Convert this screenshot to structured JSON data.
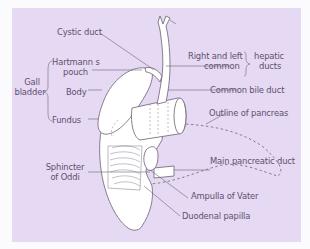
{
  "diagram": {
    "colors": {
      "background": "#e6d9f3",
      "organ_fill": "#ffffff",
      "outline": "#6b6070",
      "text": "#5e4f6e",
      "leader": "#6b6474"
    },
    "labels": {
      "cystic_duct": "Cystic duct",
      "hartmann_line1": "Hartmann s",
      "hartmann_line2": "pouch",
      "gall_line1": "Gall",
      "gall_line2": "bladder",
      "body": "Body",
      "fundus": "Fundus",
      "right_left": "Right and left",
      "common": "common",
      "hepatic": "hepatic",
      "ducts": "ducts",
      "common_bile_duct": "Common bile duct",
      "outline_pancreas": "Outline of pancreas",
      "sphincter_line1": "Sphincter",
      "sphincter_line2": "of Oddi",
      "main_pancreatic_duct": "Main pancreatic duct",
      "ampulla_of_vater": "Ampulla of Vater",
      "duodenal_papilla": "Duodenal papilla"
    }
  }
}
